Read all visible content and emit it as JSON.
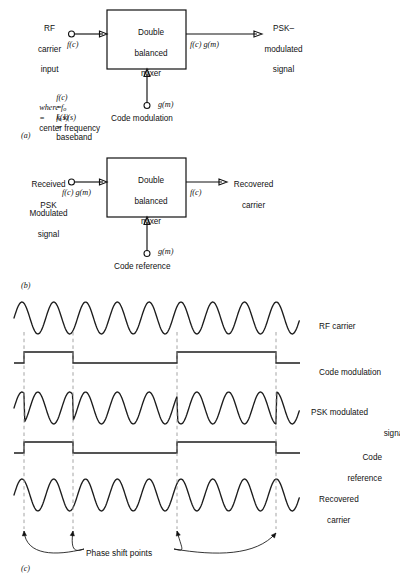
{
  "figure": {
    "panel_a": {
      "id": "(a)",
      "block_label_lines": [
        "Double",
        "balanced",
        "mixer"
      ],
      "input_label_lines": [
        "RF",
        "carrier",
        "input"
      ],
      "input_signal": "f(c)",
      "output_label_lines": [
        "PSK–",
        "modulated",
        "signal"
      ],
      "output_signal": "f(c) g(m)",
      "control_signal": "g(m)",
      "control_label": "Code modulation",
      "equations": [
        {
          "lhs": "f(c)",
          "rel": "=",
          "rhs": "f",
          "rhs_sub": "o",
          "rhs_tail": " k(s)"
        },
        {
          "lhs": "where f",
          "rel": "=",
          "rhs": "center frequency",
          "lhs_sub": "o"
        },
        {
          "lhs": "k(s)",
          "rel": "=",
          "rhs": "baseband"
        }
      ],
      "equation_text": [
        "f(c) = f₀ k(s)",
        "where f₀ = center frequency",
        "k(s) = baseband"
      ]
    },
    "panel_b": {
      "id": "(b)",
      "block_label_lines": [
        "Double",
        "balanced",
        "mixer"
      ],
      "input_label_lines": [
        "Received",
        "PSK"
      ],
      "input_label_lines2": [
        "Modulated",
        "signal"
      ],
      "input_signal": "f(c) g(m)",
      "output_label_lines": [
        "Recovered",
        "carrier"
      ],
      "output_signal": "f(c)",
      "control_signal": "g(m)",
      "control_label": "Code reference"
    },
    "panel_c": {
      "id": "(c)",
      "annotation": "Phase shift points",
      "rows": [
        {
          "name": "rf-carrier",
          "label_lines": [
            "RF carrier"
          ],
          "type": "sine",
          "inverted_segments": []
        },
        {
          "name": "code-modulation",
          "label_lines": [
            "Code modulation"
          ],
          "type": "square"
        },
        {
          "name": "psk-modulated-signal",
          "label_lines": [
            "PSK modulated",
            "signal"
          ],
          "type": "psk"
        },
        {
          "name": "code-reference",
          "label_lines": [
            "Code",
            "reference"
          ],
          "type": "square"
        },
        {
          "name": "recovered-carrier",
          "label_lines": [
            "Recovered",
            "carrier"
          ],
          "type": "sine"
        }
      ]
    }
  },
  "chart_data": {
    "type": "line",
    "title": "",
    "xlabel": "",
    "ylabel": "",
    "waveform_x_start": 14,
    "waveform_x_end": 300,
    "carrier_period_px": 31.8,
    "phase_shift_points_px": [
      24,
      73,
      177,
      276
    ],
    "code_high_intervals_px": [
      [
        24,
        73
      ],
      [
        177,
        276
      ]
    ],
    "rows_y_center_px": [
      318,
      363,
      408,
      453,
      495
    ],
    "sine_amplitude_px": 16,
    "square_amplitude_px": 11,
    "series": [
      {
        "name": "RF carrier",
        "type": "sine",
        "phase_inversions": []
      },
      {
        "name": "Code modulation",
        "type": "square",
        "levels": [
          0,
          1,
          0,
          1,
          0
        ]
      },
      {
        "name": "PSK modulated signal",
        "type": "sine",
        "phase_inversions": [
          24,
          73,
          177,
          276
        ]
      },
      {
        "name": "Code reference",
        "type": "square",
        "levels": [
          0,
          1,
          0,
          1,
          0
        ]
      },
      {
        "name": "Recovered carrier",
        "type": "sine",
        "phase_inversions": []
      }
    ]
  }
}
